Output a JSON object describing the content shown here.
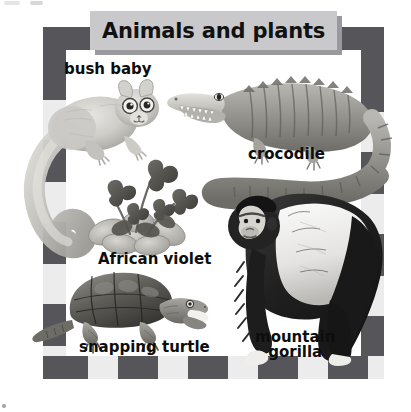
{
  "page": {
    "title": "Animals and plants",
    "background_color": "#ffffff"
  },
  "banner": {
    "title": "Animals and plants",
    "fill_color": "#c9c9cb",
    "shadow_color": "#9a9a9e",
    "text_color": "#111111"
  },
  "frame": {
    "style": "checkered-border",
    "dark_color": "#56565a",
    "light_color": "#ececed"
  },
  "labels": {
    "bush_baby": "bush baby",
    "crocodile": "crocodile",
    "african_violet": "African violet",
    "snapping_turtle": "snapping turtle",
    "mountain_gorilla_line1": "mountain",
    "mountain_gorilla_line2": "gorilla"
  },
  "illustrations": [
    {
      "name": "bush-baby",
      "kind": "animal",
      "label": "bush baby"
    },
    {
      "name": "crocodile",
      "kind": "animal",
      "label": "crocodile"
    },
    {
      "name": "african-violet",
      "kind": "plant",
      "label": "African violet"
    },
    {
      "name": "snapping-turtle",
      "kind": "animal",
      "label": "snapping turtle"
    },
    {
      "name": "mountain-gorilla",
      "kind": "animal",
      "label": "mountain gorilla"
    }
  ]
}
